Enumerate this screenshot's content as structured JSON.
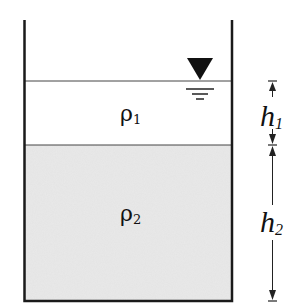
{
  "diagram": {
    "type": "two-layer fluid tank",
    "colors": {
      "background": "#ffffff",
      "wall": "#1a1a1a",
      "fluid_upper": "#ffffff",
      "fluid_lower": "#e9e9e9",
      "line": "#333333"
    },
    "layers": [
      {
        "name": "upper",
        "density_symbol": "ρ",
        "density_subscript": "1",
        "height_symbol": "h",
        "height_subscript": "1"
      },
      {
        "name": "lower",
        "density_symbol": "ρ",
        "density_subscript": "2",
        "height_symbol": "h",
        "height_subscript": "2"
      }
    ],
    "free_surface_symbol": "inverted-triangle-water-level",
    "dimensions": [
      "h1",
      "h2"
    ]
  }
}
